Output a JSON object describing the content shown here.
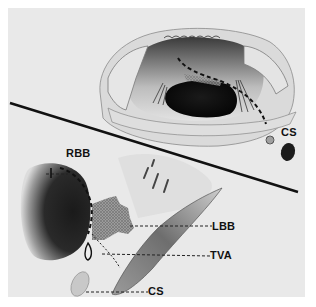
{
  "figure": {
    "background": "#e9e9e9",
    "divider_color": "#111111",
    "top_panel": {
      "description": "Surgical view of opened right atrium showing tricuspid valve orifice with dashed incision line",
      "labels": [
        {
          "id": "cs_top",
          "text": "CS"
        }
      ]
    },
    "bottom_panel": {
      "description": "Schematic of conduction tissue near membranous septum",
      "labels": [
        {
          "id": "rbb",
          "text": "RBB"
        },
        {
          "id": "lbb",
          "text": "LBB"
        },
        {
          "id": "tva",
          "text": "TVA"
        },
        {
          "id": "cs_bottom",
          "text": "CS"
        }
      ]
    }
  }
}
